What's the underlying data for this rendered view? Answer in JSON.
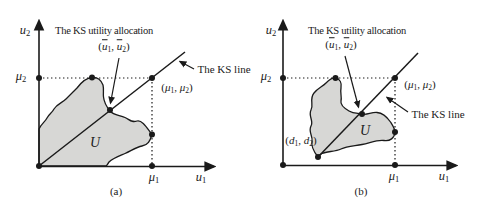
{
  "figure": {
    "colors": {
      "background": "#ffffff",
      "ink": "#1a1a1a",
      "region_fill": "#d7d7d5"
    },
    "symbols": {
      "u": "u",
      "mu": "μ",
      "d": "d",
      "one": "1",
      "two": "2",
      "open": "(",
      "close": ")",
      "comma": ", "
    },
    "diagram_a": {
      "caption": "(a)",
      "annotation_title": "The KS utility allocation",
      "ks_line_label": "The KS line",
      "set_label": "U"
    },
    "diagram_b": {
      "caption": "(b)",
      "annotation_title": "The KS utility allocation",
      "ks_line_label": "The KS line",
      "set_label": "U"
    }
  }
}
